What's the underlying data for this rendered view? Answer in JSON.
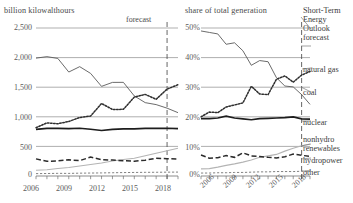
{
  "left": {
    "title": "billion kilowalthours",
    "forecast_label": "forecast",
    "yticks": [
      "2,500",
      "2,000",
      "1,500",
      "1,000",
      "500",
      "0"
    ],
    "xticks": [
      "2006",
      "2009",
      "2012",
      "2015",
      "2018"
    ]
  },
  "right": {
    "title": "share of total generation",
    "yticks": [
      "50%",
      "40%",
      "30%",
      "20%",
      "10%",
      "0%"
    ],
    "xticks": [
      "2006",
      "2009",
      "2012",
      "2015",
      "2018"
    ]
  },
  "legend": {
    "forecast": "Short-Term Energy Outlook forecast",
    "forecast_l1": "Short-Term",
    "forecast_l2": "Energy",
    "forecast_l3": "Outlook",
    "forecast_l4": "forecast",
    "gas": "natural gas",
    "coal": "coal",
    "nuclear": "nuclear",
    "renew_l1": "nonhydro",
    "renew_l2": "renewables",
    "hydro": "hydropower",
    "other": "other"
  },
  "colors": {
    "coal": "#5a5a5a",
    "gas": "#2e2e2e",
    "nuclear": "#1d1d1d",
    "renewables": "#b4b4b4",
    "hydropower": "#2b2b2b",
    "other": "#6a6a6a",
    "grid": "#8c8c8c",
    "text": "#3a3a3a"
  },
  "chart_data": [
    {
      "type": "line",
      "title": "billion kilowalthours",
      "xlabel": "",
      "ylabel": "billion kilowatthours",
      "xlim": [
        2006,
        2019
      ],
      "ylim": [
        0,
        2500
      ],
      "grid": true,
      "legend_position": "right",
      "forecast_start": 2018,
      "x": [
        2006,
        2007,
        2008,
        2009,
        2010,
        2011,
        2012,
        2013,
        2014,
        2015,
        2016,
        2017,
        2018,
        2019
      ],
      "series": [
        {
          "name": "coal",
          "style": "thin-solid",
          "values": [
            1991,
            2016,
            1986,
            1756,
            1847,
            1733,
            1514,
            1581,
            1582,
            1352,
            1239,
            1206,
            1146,
            1070
          ]
        },
        {
          "name": "natural gas",
          "style": "dotted",
          "values": [
            816,
            897,
            883,
            921,
            988,
            1013,
            1225,
            1124,
            1126,
            1333,
            1378,
            1296,
            1468,
            1542
          ]
        },
        {
          "name": "nuclear",
          "style": "thick-solid",
          "values": [
            787,
            806,
            806,
            799,
            807,
            790,
            769,
            789,
            797,
            797,
            805,
            805,
            807,
            800
          ]
        },
        {
          "name": "hydropower",
          "style": "dashed",
          "values": [
            289,
            248,
            255,
            273,
            260,
            319,
            277,
            269,
            259,
            250,
            267,
            300,
            292,
            288
          ]
        },
        {
          "name": "nonhydro renewables",
          "style": "light-solid",
          "values": [
            96,
            105,
            126,
            144,
            168,
            194,
            219,
            254,
            279,
            299,
            342,
            384,
            428,
            470
          ]
        },
        {
          "name": "other",
          "style": "fine-dotted",
          "values": [
            40,
            42,
            45,
            44,
            48,
            50,
            52,
            55,
            58,
            60,
            62,
            63,
            65,
            66
          ]
        }
      ]
    },
    {
      "type": "line",
      "title": "share of total generation",
      "xlabel": "",
      "ylabel": "share of total generation",
      "xlim": [
        2006,
        2019
      ],
      "ylim": [
        0,
        50
      ],
      "grid": true,
      "legend_position": "right",
      "forecast_start": 2018,
      "x": [
        2006,
        2007,
        2008,
        2009,
        2010,
        2011,
        2012,
        2013,
        2014,
        2015,
        2016,
        2017,
        2018,
        2019
      ],
      "series": [
        {
          "name": "coal",
          "style": "thin-solid",
          "values": [
            49,
            48.5,
            48,
            44.5,
            45,
            42.3,
            37.4,
            39,
            38.6,
            33.2,
            30.4,
            30.1,
            27.5,
            24.2
          ]
        },
        {
          "name": "natural gas",
          "style": "dotted",
          "values": [
            20,
            21.6,
            21.4,
            23.3,
            24,
            24.7,
            30.3,
            27.7,
            27.5,
            32.7,
            33.8,
            31.7,
            34.1,
            35.3
          ]
        },
        {
          "name": "nuclear",
          "style": "thick-solid",
          "values": [
            19.4,
            19.4,
            19.6,
            20.2,
            19.6,
            19.3,
            19,
            19.4,
            19.5,
            19.6,
            19.7,
            20,
            19.3,
            19.2
          ]
        },
        {
          "name": "hydropower",
          "style": "dashed",
          "values": [
            7.1,
            6,
            6.2,
            6.9,
            6.3,
            7.8,
            6.8,
            6.6,
            6.3,
            6.1,
            6.5,
            7.4,
            7,
            6.6
          ]
        },
        {
          "name": "nonhydro renewables",
          "style": "light-solid",
          "values": [
            2.4,
            2.5,
            3,
            3.6,
            4.1,
            4.7,
            5.4,
            6.3,
            6.8,
            7.3,
            8.4,
            9.4,
            10.2,
            10.8
          ]
        },
        {
          "name": "other",
          "style": "fine-dotted",
          "values": [
            1,
            1,
            1.1,
            1.1,
            1.2,
            1.2,
            1.3,
            1.4,
            1.4,
            1.5,
            1.5,
            1.5,
            1.6,
            1.6
          ]
        }
      ]
    }
  ]
}
